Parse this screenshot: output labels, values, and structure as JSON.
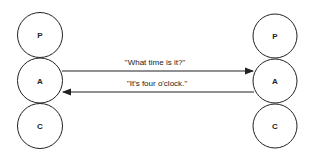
{
  "diagram": {
    "left_person": {
      "nodes": [
        {
          "label": "P",
          "cx": 40,
          "cy": 35
        },
        {
          "label": "A",
          "cx": 40,
          "cy": 80
        },
        {
          "label": "C",
          "cx": 40,
          "cy": 126
        }
      ]
    },
    "right_person": {
      "nodes": [
        {
          "label": "P",
          "cx": 275,
          "cy": 36
        },
        {
          "label": "A",
          "cx": 275,
          "cy": 82
        },
        {
          "label": "C",
          "cx": 275,
          "cy": 127
        }
      ]
    },
    "transactions": [
      {
        "text": "''What time is it?''",
        "direction": "left-to-right"
      },
      {
        "text": "''It's four o'clock.''",
        "direction": "right-to-left"
      }
    ],
    "colors": {
      "stroke": "#222222",
      "background": "#ffffff"
    }
  }
}
